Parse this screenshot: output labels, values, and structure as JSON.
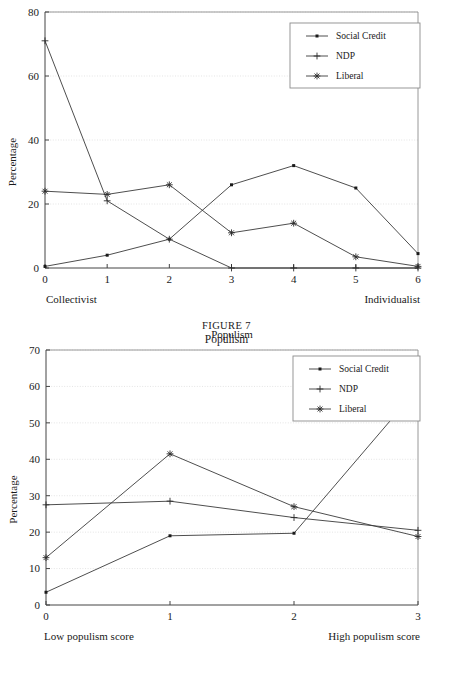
{
  "page": {
    "clipped_top_text": "",
    "figure_caption": "FIGURE 7",
    "figure_title": "Populism"
  },
  "legend": {
    "entries": [
      {
        "label": "Social Credit",
        "marker": "dot-marker"
      },
      {
        "label": "NDP",
        "marker": "plus-marker"
      },
      {
        "label": "Liberal",
        "marker": "asterisk-marker"
      }
    ]
  },
  "chart_data": [
    {
      "id": "chart-collectivist-individualist",
      "type": "line",
      "title": "",
      "xlabel": "",
      "ylabel": "Percentage",
      "x": [
        0,
        1,
        2,
        3,
        4,
        5,
        6
      ],
      "xticklabels": [
        "0",
        "1",
        "2",
        "3",
        "4",
        "5",
        "6"
      ],
      "xlim": [
        0,
        6
      ],
      "ylim": [
        0,
        80
      ],
      "yticks": [
        0,
        20,
        40,
        60,
        80
      ],
      "yticklabels": [
        "0",
        "20",
        "40",
        "60",
        "80"
      ],
      "grid": true,
      "legend_position": "upper-right",
      "axis_end_labels": {
        "left": "Collectivist",
        "right": "Individualist"
      },
      "series": [
        {
          "name": "Social Credit",
          "marker": "dot-marker",
          "values": [
            0.5,
            4,
            9,
            26,
            32,
            25,
            4.5
          ]
        },
        {
          "name": "NDP",
          "marker": "plus-marker",
          "values": [
            71,
            21,
            9,
            0,
            0,
            0,
            0
          ]
        },
        {
          "name": "Liberal",
          "marker": "asterisk-marker",
          "values": [
            24,
            23,
            26,
            11,
            14,
            3.5,
            0.5
          ]
        }
      ]
    },
    {
      "id": "chart-populism",
      "type": "line",
      "title": "Populism",
      "xlabel": "",
      "ylabel": "Percentage",
      "x": [
        0,
        1,
        2,
        3
      ],
      "xticklabels": [
        "0",
        "1",
        "2",
        "3"
      ],
      "xlim": [
        0,
        3
      ],
      "ylim": [
        0,
        70
      ],
      "yticks": [
        0,
        10,
        20,
        30,
        40,
        50,
        60,
        70
      ],
      "yticklabels": [
        "0",
        "10",
        "20",
        "30",
        "40",
        "50",
        "60",
        "70"
      ],
      "grid": true,
      "legend_position": "upper-right",
      "axis_end_labels": {
        "left": "Low populism score",
        "right": "High populism score"
      },
      "series": [
        {
          "name": "Social Credit",
          "marker": "dot-marker",
          "values": [
            3.5,
            19,
            19.7,
            59.5
          ]
        },
        {
          "name": "NDP",
          "marker": "plus-marker",
          "values": [
            27.5,
            28.5,
            24,
            20.5
          ]
        },
        {
          "name": "Liberal",
          "marker": "asterisk-marker",
          "values": [
            13,
            41.5,
            27,
            18.8
          ]
        }
      ]
    }
  ],
  "colors": {
    "ink": "#1a1a1a",
    "series_stroke": "#3a3a3a",
    "frame": "#8c8c8c",
    "grid": "#d8d8d8",
    "background": "#ffffff"
  }
}
